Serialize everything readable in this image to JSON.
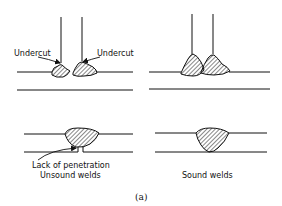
{
  "figure": {
    "caption": "(a)",
    "panels": [
      {
        "id": "top-left",
        "description": "T-joint fillet welds with undercut",
        "labels": [
          "Undercut",
          "Undercut"
        ]
      },
      {
        "id": "top-right",
        "description": "T-joint fillet welds, sound"
      },
      {
        "id": "bottom-left",
        "description": "Butt weld with lack of penetration",
        "labels": [
          "Lack of penetration",
          "Unsound welds"
        ]
      },
      {
        "id": "bottom-right",
        "description": "Butt weld, sound",
        "labels": [
          "Sound welds"
        ]
      }
    ]
  },
  "labels": {
    "undercut_left": "Undercut",
    "undercut_right": "Undercut",
    "lack_of_penetration": "Lack of penetration",
    "unsound_welds": "Unsound welds",
    "sound_welds": "Sound welds",
    "caption": "(a)"
  },
  "colors": {
    "ink": "#111111",
    "background": "#ffffff"
  }
}
